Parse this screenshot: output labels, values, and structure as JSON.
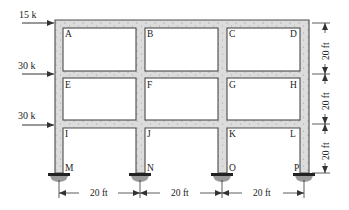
{
  "figure": {
    "type": "three-story three-bay rigid frame",
    "loads": [
      {
        "label": "15 k",
        "level": "roof",
        "joint": "A"
      },
      {
        "label": "30 k",
        "level": "second",
        "joint": "E"
      },
      {
        "label": "30 k",
        "level": "first",
        "joint": "I"
      }
    ],
    "joints": {
      "A": "A",
      "B": "B",
      "C": "C",
      "D": "D",
      "E": "E",
      "F": "F",
      "G": "G",
      "H": "H",
      "I": "I",
      "J": "J",
      "K": "K",
      "L": "L",
      "M": "M",
      "N": "N",
      "O": "O",
      "P": "P"
    },
    "horizontal_dimensions": [
      "20 ft",
      "20 ft",
      "20 ft"
    ],
    "vertical_dimensions": [
      "20 ft",
      "20 ft",
      "20 ft"
    ],
    "supports": [
      "fixed",
      "fixed",
      "fixed",
      "fixed"
    ],
    "colors": {
      "member_fill": "#d9d9d9",
      "member_edge": "#555555",
      "support_hatch": "#9a9a9a",
      "text": "#222222"
    }
  }
}
